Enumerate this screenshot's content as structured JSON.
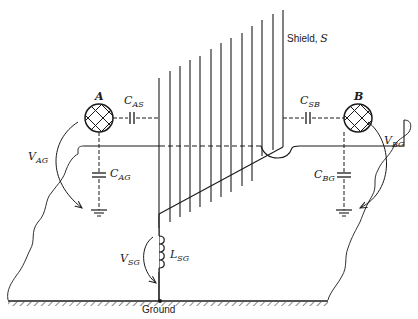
{
  "diagram": {
    "labels": {
      "shield": "Shield, ",
      "shield_symbol": "S",
      "node_a": "A",
      "node_b": "B",
      "c_as": {
        "main": "C",
        "sub": "AS"
      },
      "c_sb": {
        "main": "C",
        "sub": "SB"
      },
      "c_ag": {
        "main": "C",
        "sub": "AG"
      },
      "c_bg": {
        "main": "C",
        "sub": "BG"
      },
      "v_ag": {
        "main": "V",
        "sub": "AG"
      },
      "v_bg": {
        "main": "V",
        "sub": "BG"
      },
      "v_sg": {
        "main": "V",
        "sub": "SG"
      },
      "l_sg": {
        "main": "L",
        "sub": "SG"
      },
      "ground": "Ground"
    },
    "components": [
      {
        "id": "A",
        "type": "conductor",
        "note": "cross-hatched circle, left"
      },
      {
        "id": "B",
        "type": "conductor",
        "note": "cross-hatched circle, right"
      },
      {
        "id": "C_AS",
        "type": "capacitor",
        "between": [
          "A",
          "S"
        ]
      },
      {
        "id": "C_SB",
        "type": "capacitor",
        "between": [
          "S",
          "B"
        ]
      },
      {
        "id": "C_AG",
        "type": "capacitor",
        "between": [
          "A",
          "Ground"
        ]
      },
      {
        "id": "C_BG",
        "type": "capacitor",
        "between": [
          "B",
          "Ground"
        ]
      },
      {
        "id": "L_SG",
        "type": "inductor",
        "between": [
          "S",
          "Ground"
        ]
      },
      {
        "id": "S",
        "type": "shield",
        "note": "vertical line shield plane"
      }
    ],
    "colors": {
      "ink": "#1a1a1a",
      "background": "#ffffff"
    }
  }
}
